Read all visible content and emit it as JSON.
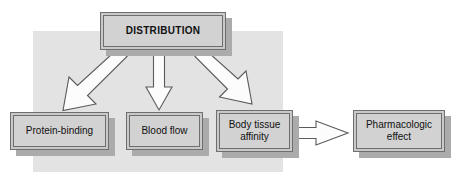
{
  "diagram": {
    "colors": {
      "backdrop": "#e3e3e3",
      "box_fill": "#d2d2d2",
      "box_border": "#6e6e6e",
      "shadow": "#ababab",
      "arrow_fill": "#ffffff",
      "arrow_outline": "#555555",
      "text": "#111111",
      "page_background": "#ffffff"
    },
    "nodes": [
      {
        "id": "distribution",
        "label": "DISTRIBUTION",
        "style": "title",
        "x": 100,
        "y": 12,
        "w": 126,
        "h": 38
      },
      {
        "id": "protein-binding",
        "label": "Protein-binding",
        "style": "body",
        "x": 10,
        "y": 112,
        "w": 99,
        "h": 38
      },
      {
        "id": "blood-flow",
        "label": "Blood flow",
        "style": "body",
        "x": 126,
        "y": 112,
        "w": 77,
        "h": 38
      },
      {
        "id": "body-tissue-affinity",
        "label": "Body tissue\naffinity",
        "style": "body",
        "x": 216,
        "y": 110,
        "w": 77,
        "h": 42
      },
      {
        "id": "pharmacologic-effect",
        "label": "Pharmacologic\neffect",
        "style": "body",
        "x": 353,
        "y": 110,
        "w": 92,
        "h": 42
      }
    ],
    "arrows": [
      {
        "id": "distribution-to-protein-binding",
        "from": "distribution",
        "to": "protein-binding",
        "direction": "down-left"
      },
      {
        "id": "distribution-to-blood-flow",
        "from": "distribution",
        "to": "blood-flow",
        "direction": "down"
      },
      {
        "id": "distribution-to-body-tissue-affinity",
        "from": "distribution",
        "to": "body-tissue-affinity",
        "direction": "down-right"
      },
      {
        "id": "body-tissue-affinity-to-pharmacologic-effect",
        "from": "body-tissue-affinity",
        "to": "pharmacologic-effect",
        "direction": "right"
      }
    ],
    "backdrop_panel": {
      "x": 33,
      "y": 31,
      "w": 250,
      "h": 141
    }
  }
}
